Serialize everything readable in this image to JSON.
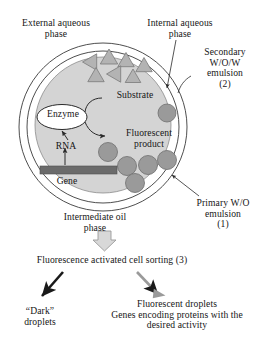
{
  "figure": {
    "labels": {
      "external_aqueous_phase": "External aqueous\nphase",
      "internal_aqueous_phase": "Internal aqueous\nphase",
      "secondary_emulsion": "Secondary\nW/O/W\nemulsion\n(2)",
      "substrate": "Substrate",
      "enzyme": "Enzyme",
      "fluorescent_product": "Fluorescent\nproduct",
      "rna": "RNA",
      "gene": "Gene",
      "primary_emulsion": "Primary W/O\nemulsion\n(1)",
      "intermediate_oil_phase": "Intermediate oil\nphase",
      "facs_step": "Fluorescence activated cell sorting (3)",
      "dark_droplets": "“Dark”\ndroplets",
      "fluorescent_droplets": "Fluorescent droplets\nGenes encoding proteins with the\ndesired activity"
    },
    "colors": {
      "inner_aqueous_fill": "#d4d4d4",
      "droplet_fill": "#9a9a9a",
      "droplet_stroke": "#6e6e6e",
      "substrate_fill": "#b3b3b3",
      "substrate_stroke": "#7d7d7d",
      "gene_bar_fill": "#6b6b6b",
      "enzyme_fill": "#ffffff",
      "outline_stroke": "#3a3a3a",
      "black_arrow": "#1a1a1a",
      "gray_arrow": "#9a9a9a",
      "block_arrow_fill": "#d8d8d8",
      "text": "#161616",
      "background": "#ffffff"
    },
    "shapes": {
      "outer_circle": {
        "cx": 103,
        "cy": 127,
        "r": 84,
        "stroke_width": 0.9
      },
      "middle_circle": {
        "cx": 103,
        "cy": 127,
        "r": 76,
        "stroke_width": 0.9
      },
      "inner_aqueous_circle": {
        "cx": 103,
        "cy": 125,
        "r": 68,
        "stroke_width": 0.8
      },
      "enzyme_ellipse": {
        "cx": 62,
        "cy": 117,
        "rx": 25,
        "ry": 12.5
      },
      "gene_bar": {
        "x": 40,
        "y": 166,
        "width": 77,
        "height": 8
      },
      "substrate_triangles": [
        {
          "cx": 92,
          "cy": 62,
          "size": 9.5,
          "rotation": -90
        },
        {
          "cx": 109,
          "cy": 59,
          "size": 10,
          "rotation": 0
        },
        {
          "cx": 126,
          "cy": 62,
          "size": 9.5,
          "rotation": 0
        },
        {
          "cx": 144,
          "cy": 67,
          "size": 9.5,
          "rotation": 0
        },
        {
          "cx": 96,
          "cy": 77,
          "size": 9.5,
          "rotation": 0
        },
        {
          "cx": 116,
          "cy": 74,
          "size": 9.5,
          "rotation": -90
        },
        {
          "cx": 133,
          "cy": 78,
          "size": 9,
          "rotation": 0
        }
      ],
      "product_droplets": [
        {
          "cx": 167,
          "cy": 113,
          "r": 9
        },
        {
          "cx": 108,
          "cy": 152,
          "r": 9.5
        },
        {
          "cx": 127,
          "cy": 166,
          "r": 9.5
        },
        {
          "cx": 148,
          "cy": 165,
          "r": 9.5
        },
        {
          "cx": 167,
          "cy": 160,
          "r": 9.5
        },
        {
          "cx": 135,
          "cy": 183,
          "r": 9.5
        }
      ]
    },
    "arrows": {
      "internal_phase_pointer": "from label down to inner aqueous boundary",
      "secondary_emulsion_pointer": "curved leader to outer circle",
      "primary_emulsion_pointer": "leader up-left to middle circle",
      "substrate_to_enzyme": "curve from substrate label to enzyme",
      "enzyme_to_product": "curve from enzyme to fluorescent product",
      "gene_to_rna_to_enzyme": "upward arrow from gene bar through RNA to enzyme",
      "facs_block_arrow": "downward block arrow",
      "sort_dark": "black arrow down-left to dark droplets",
      "sort_fluorescent": "gray arrow down-right to fluorescent droplets"
    }
  }
}
